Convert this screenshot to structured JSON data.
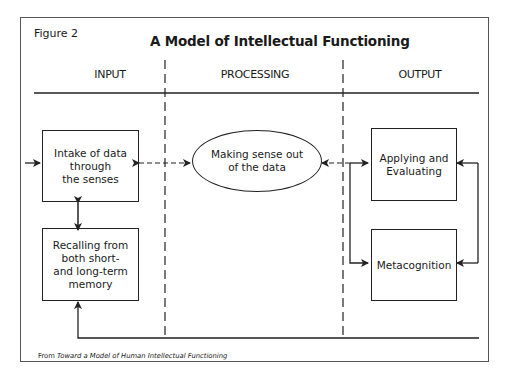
{
  "figure": {
    "label": "Figure 2",
    "title": "A Model of Intellectual Functioning"
  },
  "columns": [
    {
      "label": "INPUT"
    },
    {
      "label": "PROCESSING"
    },
    {
      "label": "OUTPUT"
    }
  ],
  "nodes": {
    "intake": "Intake of data through the senses",
    "intake_lines": [
      "Intake of data",
      "through",
      "the senses"
    ],
    "recall": "Recalling from both short- and long-term memory",
    "recall_lines": [
      "Recalling from",
      "both short-",
      "and long-term",
      "memory"
    ],
    "processing": "Making sense out of the data",
    "processing_lines": [
      "Making sense out",
      "of the data"
    ],
    "applying": "Applying and Evaluating",
    "applying_lines": [
      "Applying and",
      "Evaluating"
    ],
    "metacognition": "Metacognition"
  },
  "edges": [
    {
      "from": "external",
      "to": "intake",
      "type": "arrow"
    },
    {
      "from": "intake",
      "to": "recall",
      "type": "bidirectional"
    },
    {
      "from": "processing",
      "to": "intake",
      "type": "bidirectional-dashed"
    },
    {
      "from": "output-bus",
      "to": "processing",
      "type": "arrow"
    },
    {
      "from": "output-bus",
      "to": "applying",
      "type": "arrow"
    },
    {
      "from": "output-bus",
      "to": "metacognition",
      "type": "arrow"
    },
    {
      "from": "right-loop",
      "to": "applying",
      "type": "arrow"
    },
    {
      "from": "right-loop",
      "to": "metacognition",
      "type": "arrow"
    },
    {
      "from": "feedback-line",
      "to": "recall",
      "type": "arrow"
    }
  ],
  "caption": {
    "prefix": "From ",
    "source_title": "Toward a Model of Human Intellectual Functioning"
  },
  "colors": {
    "line": "#222222",
    "frame": "#555555",
    "background": "#ffffff"
  }
}
